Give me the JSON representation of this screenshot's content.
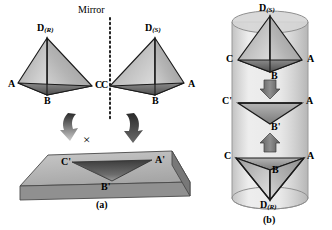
{
  "figure": {
    "title_parts": {
      "mirror_label": "Mirror"
    },
    "panels": [
      {
        "id": "a",
        "caption": "(a)"
      },
      {
        "id": "b",
        "caption": "(b)"
      }
    ]
  },
  "panel_a": {
    "mirror_label": "Mirror",
    "cross_mark": "×",
    "caption": "(a)",
    "tetrahedron_left": {
      "name": "R-enantiomer",
      "apex_label": "D",
      "apex_subscript": "(R)",
      "vertex_left": "A",
      "vertex_right": "C",
      "vertex_bottom": "B"
    },
    "tetrahedron_right": {
      "name": "S-enantiomer",
      "apex_label": "D",
      "apex_subscript": "(S)",
      "vertex_left": "C",
      "vertex_right": "A",
      "vertex_bottom": "B"
    },
    "surface": {
      "name": "flat-substrate-slab",
      "vertex_left": "C'",
      "vertex_right": "A'",
      "vertex_bottom": "B'"
    },
    "arrows": [
      {
        "name": "curved-arrow-left",
        "direction": "down-right",
        "state": "blocked"
      },
      {
        "name": "curved-arrow-right",
        "direction": "down-left",
        "state": "allowed"
      }
    ]
  },
  "panel_b": {
    "caption": "(b)",
    "container": "cylinder",
    "top_unit": {
      "apex_label": "D",
      "apex_subscript": "(S)",
      "vertex_left": "C",
      "vertex_right": "A",
      "vertex_bottom": "B"
    },
    "middle_unit": {
      "vertex_left": "C'",
      "vertex_right": "A",
      "vertex_bottom": "B'"
    },
    "bottom_unit": {
      "vertex_left": "C",
      "vertex_right": "A",
      "vertex_center": "B",
      "apex_label": "D",
      "apex_subscript": "(R)"
    },
    "arrows": [
      {
        "name": "block-arrow-down",
        "direction": "down"
      },
      {
        "name": "block-arrow-up",
        "direction": "up"
      }
    ]
  },
  "colors": {
    "face_light": "#d6d6d6",
    "face_mid": "#a8a8a8",
    "face_dark": "#6e6e6e",
    "edge": "#1a1a1a",
    "slab_top": "#b9b9b9",
    "slab_side": "#8c8c8c",
    "cylinder": "#cfcfcf",
    "background": "#ffffff",
    "text": "#000000"
  }
}
